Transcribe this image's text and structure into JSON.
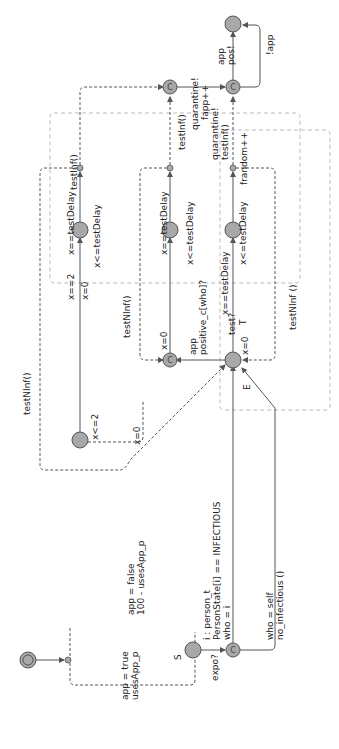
{
  "diagram": {
    "type": "timed-automaton",
    "orientation": "rotated-90-ccw",
    "locations": {
      "init": {
        "label": "",
        "kind": "initial"
      },
      "S": {
        "label": "S"
      },
      "E": {
        "label": "E"
      },
      "T": {
        "label": "T"
      },
      "committed_marker": "C"
    },
    "labels": {
      "app_true": "app = true",
      "usesApp_p": "usesApp_p",
      "app_false": "app = false",
      "usesApp_100": "100 - usesApp_p",
      "expo": "expo?",
      "i_person": "i : person_t",
      "person_state": "PersonState[i] == INFECTIOUS",
      "who_i": "who = i",
      "who_self": "who = self",
      "no_infectious": "no_infectious ()",
      "x0_e": "x=0",
      "app_pos": "app",
      "positive_c": "positive_c[who]?",
      "x0_c": "x=0",
      "x0_loop": "x=0",
      "x_le_2": "x<=2",
      "x_eq_2": "x==2",
      "x0_top": "x=0",
      "x_eq_testDelay_1": "x==testDelay",
      "x_le_testDelay_1": "x<=testDelay",
      "testNInf_1": "testNInf()",
      "testNInf_2": "testNInf()",
      "x_eq_testDelay_2": "x==testDelay",
      "x_le_testDelay_2": "x<=testDelay",
      "testInf_1": "testInf()",
      "testInf_2": "testInf()",
      "test_q": "test?",
      "x_eq_testDelay_3": "x==testDelay",
      "x_le_testDelay_3": "x<=testDelay",
      "testNInf_3": "testNInf ()",
      "quarantine_1": "quarantine!",
      "fapp": "fapp++",
      "quarantine_2": "quarantine!",
      "testInf_3": "testInf()",
      "frandom": "frandom++",
      "app_final": "app",
      "pos": "pos!",
      "not_app": "!app"
    }
  }
}
